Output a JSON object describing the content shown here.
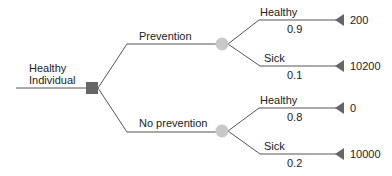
{
  "root": {
    "label_line1": "Healthy",
    "label_line2": "Individual",
    "node_type": "decision"
  },
  "branches": [
    {
      "label": "Prevention",
      "node_type": "chance",
      "outcomes": [
        {
          "label": "Healthy",
          "probability": "0.9",
          "value": "200"
        },
        {
          "label": "Sick",
          "probability": "0.1",
          "value": "10200"
        }
      ]
    },
    {
      "label": "No prevention",
      "node_type": "chance",
      "outcomes": [
        {
          "label": "Healthy",
          "probability": "0.8",
          "value": "0"
        },
        {
          "label": "Sick",
          "probability": "0.2",
          "value": "10000"
        }
      ]
    }
  ],
  "colors": {
    "line": "#555555",
    "decision": "#666666",
    "chance": "#c8c8c8",
    "terminal": "#666666"
  }
}
